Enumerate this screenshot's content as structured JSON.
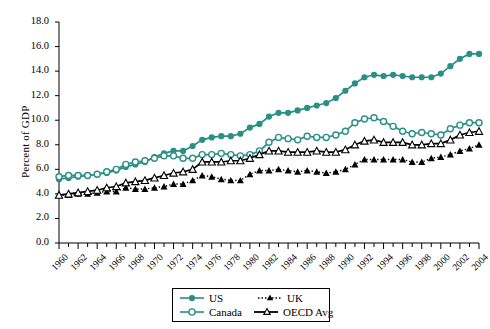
{
  "chart_data": {
    "type": "line",
    "title": "",
    "xlabel": "",
    "ylabel": "Percent of GDP",
    "xlim": [
      1960,
      2004
    ],
    "ylim": [
      0.0,
      18.0
    ],
    "yticks": [
      "0.0",
      "2.0",
      "4.0",
      "6.0",
      "8.0",
      "10.0",
      "12.0",
      "14.0",
      "16.0",
      "18.0"
    ],
    "ytick_values": [
      0,
      2,
      4,
      6,
      8,
      10,
      12,
      14,
      16,
      18
    ],
    "xticks": [
      "1960",
      "1962",
      "1964",
      "1966",
      "1968",
      "1970",
      "1972",
      "1974",
      "1976",
      "1978",
      "1980",
      "1982",
      "1984",
      "1986",
      "1988",
      "1990",
      "1992",
      "1994",
      "1996",
      "1998",
      "2000",
      "2002",
      "2004"
    ],
    "xtick_values": [
      1960,
      1962,
      1964,
      1966,
      1968,
      1970,
      1972,
      1974,
      1976,
      1978,
      1980,
      1982,
      1984,
      1986,
      1988,
      1990,
      1992,
      1994,
      1996,
      1998,
      2000,
      2002,
      2004
    ],
    "minor_tick_interval": 1,
    "grid": false,
    "legend_position": "below-center",
    "x": [
      1960,
      1961,
      1962,
      1963,
      1964,
      1965,
      1966,
      1967,
      1968,
      1969,
      1970,
      1971,
      1972,
      1973,
      1974,
      1975,
      1976,
      1977,
      1978,
      1979,
      1980,
      1981,
      1982,
      1983,
      1984,
      1985,
      1986,
      1987,
      1988,
      1989,
      1990,
      1991,
      1992,
      1993,
      1994,
      1995,
      1996,
      1997,
      1998,
      1999,
      2000,
      2001,
      2002,
      2003,
      2004
    ],
    "series": [
      {
        "name": "US",
        "color": "#2a8f87",
        "marker": "filled-circle",
        "line": "solid",
        "values": [
          5.2,
          5.3,
          5.4,
          5.5,
          5.6,
          5.7,
          5.9,
          6.2,
          6.4,
          6.6,
          7.0,
          7.3,
          7.5,
          7.5,
          7.9,
          8.4,
          8.6,
          8.7,
          8.7,
          8.9,
          9.4,
          9.7,
          10.3,
          10.6,
          10.6,
          10.8,
          11.0,
          11.2,
          11.4,
          11.8,
          12.4,
          13.0,
          13.5,
          13.7,
          13.6,
          13.7,
          13.6,
          13.5,
          13.5,
          13.5,
          13.8,
          14.4,
          15.0,
          15.4,
          15.4
        ]
      },
      {
        "name": "Canada",
        "color": "#2a8f87",
        "marker": "open-circle",
        "line": "solid",
        "values": [
          5.4,
          5.5,
          5.5,
          5.5,
          5.6,
          5.8,
          6.0,
          6.4,
          6.6,
          6.7,
          6.9,
          7.1,
          7.1,
          6.9,
          6.9,
          7.2,
          7.2,
          7.3,
          7.2,
          7.1,
          7.2,
          7.5,
          8.2,
          8.6,
          8.5,
          8.4,
          8.7,
          8.6,
          8.6,
          8.8,
          9.1,
          9.8,
          10.1,
          10.2,
          9.9,
          9.5,
          9.1,
          8.9,
          9.0,
          8.9,
          8.8,
          9.3,
          9.6,
          9.8,
          9.8
        ]
      },
      {
        "name": "UK",
        "color": "#000000",
        "marker": "filled-triangle",
        "line": "dotted",
        "values": [
          3.9,
          3.9,
          4.0,
          4.0,
          4.1,
          4.2,
          4.2,
          4.5,
          4.4,
          4.4,
          4.5,
          4.6,
          4.8,
          4.8,
          5.1,
          5.5,
          5.4,
          5.2,
          5.1,
          5.1,
          5.6,
          5.9,
          5.9,
          6.0,
          5.9,
          5.8,
          5.9,
          5.8,
          5.7,
          5.8,
          6.0,
          6.4,
          6.8,
          6.8,
          6.8,
          6.8,
          6.8,
          6.6,
          6.6,
          6.9,
          7.0,
          7.2,
          7.5,
          7.7,
          8.0
        ]
      },
      {
        "name": "OECD Avg",
        "color": "#000000",
        "marker": "open-triangle",
        "line": "solid",
        "values": [
          3.9,
          4.0,
          4.1,
          4.2,
          4.3,
          4.5,
          4.6,
          4.9,
          5.0,
          5.1,
          5.3,
          5.5,
          5.7,
          5.8,
          6.0,
          6.6,
          6.6,
          6.6,
          6.7,
          6.7,
          6.9,
          7.2,
          7.5,
          7.5,
          7.4,
          7.4,
          7.4,
          7.5,
          7.4,
          7.4,
          7.6,
          8.0,
          8.3,
          8.4,
          8.2,
          8.2,
          8.2,
          8.0,
          8.0,
          8.1,
          8.1,
          8.4,
          8.8,
          9.0,
          9.1
        ]
      }
    ]
  },
  "legend": {
    "entries": [
      {
        "label": "US"
      },
      {
        "label": "UK"
      },
      {
        "label": "Canada"
      },
      {
        "label": "OECD Avg"
      }
    ]
  },
  "axis": {
    "y_title": "Percent of GDP"
  }
}
